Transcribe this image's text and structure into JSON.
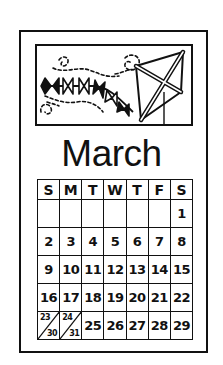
{
  "card": {
    "month": "March",
    "illustration": "kite-with-bow-tail-and-wind-swirls"
  },
  "calendar": {
    "weekdays": [
      "S",
      "M",
      "T",
      "W",
      "T",
      "F",
      "S"
    ],
    "weeks": [
      [
        "",
        "",
        "",
        "",
        "",
        "",
        "1"
      ],
      [
        "2",
        "3",
        "4",
        "5",
        "6",
        "7",
        "8"
      ],
      [
        "9",
        "10",
        "11",
        "12",
        "13",
        "14",
        "15"
      ],
      [
        "16",
        "17",
        "18",
        "19",
        "20",
        "21",
        "22"
      ],
      [
        "23/30",
        "24/31",
        "25",
        "26",
        "27",
        "28",
        "29"
      ]
    ],
    "split_cells": [
      {
        "top": "23",
        "bottom": "30"
      },
      {
        "top": "24",
        "bottom": "31"
      }
    ]
  },
  "colors": {
    "ink": "#111111",
    "paper": "#ffffff"
  }
}
